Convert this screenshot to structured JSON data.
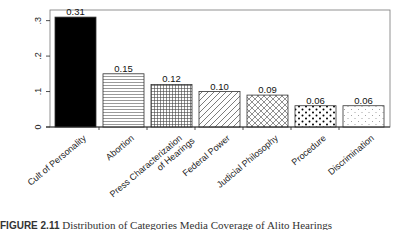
{
  "chart_data": {
    "type": "bar",
    "title": "",
    "xlabel": "",
    "ylabel": "",
    "ylim": [
      0,
      0.33
    ],
    "yticks": [
      0,
      0.1,
      0.2,
      0.3
    ],
    "ytick_labels": [
      "0",
      ".1",
      ".2",
      ".3"
    ],
    "grid": false,
    "legend": null,
    "categories": [
      "Cult of Personality",
      "Abortion",
      "Press Characterization of Hearings",
      "Federal Power",
      "Judicial Philosophy",
      "Procedure",
      "Discrimination"
    ],
    "category_label_lines": [
      [
        "Cult of Personality"
      ],
      [
        "Abortion"
      ],
      [
        "Press Characterization",
        "of Hearings"
      ],
      [
        "Federal Power"
      ],
      [
        "Judicial Philosophy"
      ],
      [
        "Procedure"
      ],
      [
        "Discrimination"
      ]
    ],
    "values": [
      0.31,
      0.15,
      0.12,
      0.1,
      0.09,
      0.06,
      0.06
    ],
    "data_labels": [
      "0.31",
      "0.15",
      "0.12",
      "0.10",
      "0.09",
      "0.06",
      "0.06"
    ],
    "fills": [
      "solid-black",
      "horizontal-lines",
      "grid",
      "diagonal-lines",
      "crosshatch",
      "large-dots",
      "small-dots"
    ]
  },
  "caption": {
    "label": "FIGURE 2.11",
    "text": "Distribution of Categories Media Coverage of Alito Hearings"
  }
}
